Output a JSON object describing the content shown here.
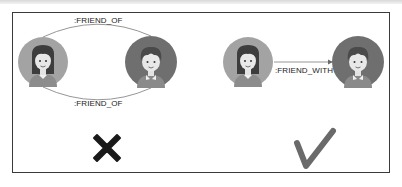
{
  "diagram": {
    "left_panel": {
      "relationship_top_label": ":FRIEND_OF",
      "relationship_bottom_label": ":FRIEND_OF",
      "nodes": [
        {
          "name": "girl",
          "avatar": "girl-avatar"
        },
        {
          "name": "boy",
          "avatar": "boy-avatar"
        }
      ],
      "verdict_icon": "cross-icon",
      "verdict": "incorrect"
    },
    "right_panel": {
      "relationship_label": ":FRIEND_WITH",
      "nodes": [
        {
          "name": "girl",
          "avatar": "girl-avatar"
        },
        {
          "name": "boy",
          "avatar": "boy-avatar"
        }
      ],
      "verdict_icon": "check-icon",
      "verdict": "correct"
    },
    "colors": {
      "border": "#3a3a3a",
      "girl_bg": "#9a9a9a",
      "boy_bg": "#6e6e6e",
      "cross": "#1a1a1a",
      "check": "#6a6a6a",
      "edge": "#8a8a8a"
    }
  }
}
